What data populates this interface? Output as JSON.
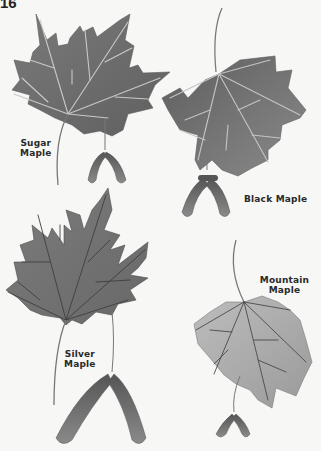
{
  "page": {
    "number": "16"
  },
  "leaves": [
    {
      "id": "sugar",
      "label_line1": "Sugar",
      "label_line2": "Maple",
      "fill": "#6f6f6f",
      "vein": "#c8c8c8"
    },
    {
      "id": "black",
      "label": "Black Maple",
      "fill": "#777777",
      "vein": "#c4c4c4"
    },
    {
      "id": "silver",
      "label_line1": "Silver",
      "label_line2": "Maple",
      "fill": "#707070",
      "vein": "#3e3e3e"
    },
    {
      "id": "mountain",
      "label": "Mountain Maple",
      "fill": "#a9a9a9",
      "vein": "#4a4a4a"
    }
  ]
}
